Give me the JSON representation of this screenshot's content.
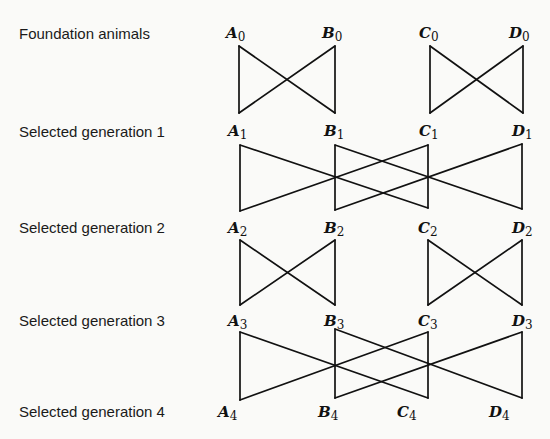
{
  "rows": [
    {
      "label": "Foundation animals",
      "generation": 0,
      "nodes": [
        "A",
        "B",
        "C",
        "D"
      ]
    },
    {
      "label": "Selected generation 1",
      "generation": 1,
      "nodes": [
        "A",
        "B",
        "C",
        "D"
      ]
    },
    {
      "label": "Selected generation 2",
      "generation": 2,
      "nodes": [
        "A",
        "B",
        "C",
        "D"
      ]
    },
    {
      "label": "Selected generation 3",
      "generation": 3,
      "nodes": [
        "A",
        "B",
        "C",
        "D"
      ]
    },
    {
      "label": "Selected generation 4",
      "generation": 4,
      "nodes": [
        "A",
        "B",
        "C",
        "D"
      ]
    }
  ],
  "subscripts": [
    "0",
    "1",
    "2",
    "3",
    "4"
  ],
  "node_letters": [
    "A",
    "B",
    "C",
    "D"
  ],
  "mating_scheme": [
    {
      "from_generation": 0,
      "to_generation": 1,
      "pattern": "adjacent pairs crossed",
      "pairs": [
        [
          "A",
          "B"
        ],
        [
          "C",
          "D"
        ]
      ]
    },
    {
      "from_generation": 1,
      "to_generation": 2,
      "pattern": "distant pairs crossed",
      "pairs": [
        [
          "A",
          "C"
        ],
        [
          "B",
          "D"
        ]
      ]
    },
    {
      "from_generation": 2,
      "to_generation": 3,
      "pattern": "adjacent pairs crossed",
      "pairs": [
        [
          "A",
          "B"
        ],
        [
          "C",
          "D"
        ]
      ]
    },
    {
      "from_generation": 3,
      "to_generation": 4,
      "pattern": "distant pairs crossed",
      "pairs": [
        [
          "A",
          "C"
        ],
        [
          "B",
          "D"
        ]
      ]
    }
  ]
}
